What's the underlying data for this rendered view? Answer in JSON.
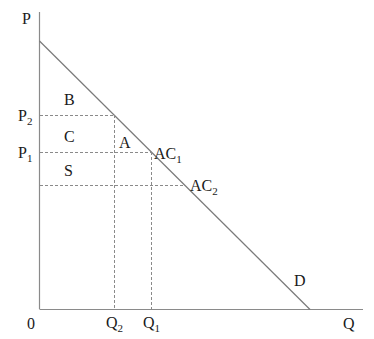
{
  "diagram": {
    "axes": {
      "y_label": "P",
      "x_label": "Q",
      "origin_label": "0"
    },
    "price_labels": {
      "p2": {
        "base": "P",
        "sub": "2"
      },
      "p1": {
        "base": "P",
        "sub": "1"
      }
    },
    "quantity_labels": {
      "q2": {
        "base": "Q",
        "sub": "2"
      },
      "q1": {
        "base": "Q",
        "sub": "1"
      }
    },
    "area_labels": {
      "b": "B",
      "c": "C",
      "a": "A",
      "s": "S"
    },
    "point_labels": {
      "ac1": {
        "base": "AC",
        "sub": "1"
      },
      "ac2": {
        "base": "AC",
        "sub": "2"
      }
    },
    "curve_label": "D",
    "colors": {
      "axis": "#8a8a8a",
      "demand": "#7a7a7a",
      "dashed": "#8a8a8a",
      "text": "#1a1a1a"
    }
  }
}
